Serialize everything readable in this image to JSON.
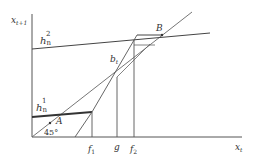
{
  "diagram": {
    "axes": {
      "y_label": "x",
      "y_label_sub": "t+1",
      "x_label": "x",
      "x_label_sub": "t"
    },
    "curves": {
      "h2_label": "h",
      "h2_sub": "n",
      "h2_sup": "2",
      "h1_label": "h",
      "h1_sub": "n",
      "h1_sup": "1",
      "bt_label": "b",
      "bt_sub": "t"
    },
    "points": {
      "A": "A",
      "B": "B"
    },
    "angle_label": "45°",
    "x_ticks": {
      "f1": "f",
      "f1_sub": "1",
      "g": "g",
      "f2": "f",
      "f2_sub": "2"
    },
    "colors": {
      "line": "#555555",
      "thick_line": "#333333",
      "text": "#333333"
    }
  }
}
